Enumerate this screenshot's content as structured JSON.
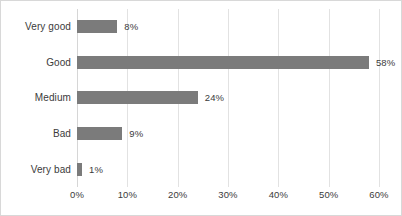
{
  "chart_data": {
    "type": "bar",
    "orientation": "horizontal",
    "title": "",
    "subtitle": "",
    "xlabel": "",
    "ylabel": "",
    "categories": [
      "Very good",
      "Good",
      "Medium",
      "Bad",
      "Very bad"
    ],
    "values": [
      8,
      58,
      24,
      9,
      1
    ],
    "data_labels": [
      "8%",
      "58%",
      "24%",
      "9%",
      "1%"
    ],
    "xlim": [
      0,
      60
    ],
    "xticks": [
      0,
      10,
      20,
      30,
      40,
      50,
      60
    ],
    "xtick_labels": [
      "0%",
      "10%",
      "20%",
      "30%",
      "40%",
      "50%",
      "60%"
    ],
    "grid": true,
    "grid_axis": "x",
    "legend": false,
    "legend_position": "none",
    "series": [
      {
        "name": "",
        "values": [
          8,
          58,
          24,
          9,
          1
        ]
      }
    ]
  },
  "style": {
    "bar_color": "#7b7b7b",
    "gridline_color": "#e2e2e2",
    "frame_color": "#d8d8d8",
    "text_color": "#3b3b3b",
    "background": "#ffffff"
  }
}
